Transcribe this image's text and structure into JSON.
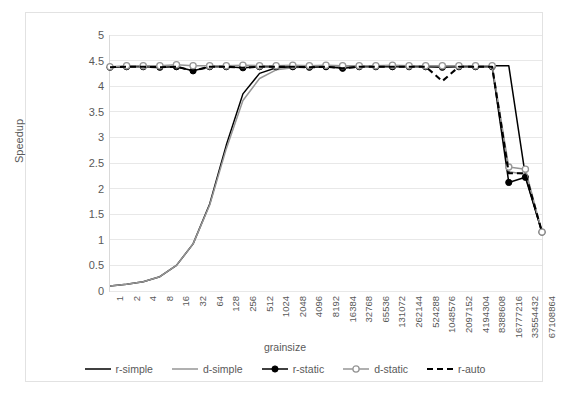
{
  "chart_data": {
    "type": "line",
    "title": "",
    "xlabel": "grainsize",
    "ylabel": "Speedup",
    "ylim": [
      0,
      5
    ],
    "ytick_step": 0.5,
    "yticks": [
      5,
      4.5,
      4,
      3.5,
      3,
      2.5,
      2,
      1.5,
      1,
      0.5,
      0
    ],
    "grid": "horizontal",
    "legend_position": "bottom",
    "x_is_categorical": true,
    "categories": [
      "1",
      "2",
      "4",
      "8",
      "16",
      "32",
      "64",
      "128",
      "256",
      "512",
      "1024",
      "2048",
      "4096",
      "8192",
      "16384",
      "32768",
      "65536",
      "131072",
      "262144",
      "524288",
      "1048576",
      "2097152",
      "4194304",
      "8388608",
      "16777216",
      "33554432",
      "67108864"
    ],
    "series": [
      {
        "name": "r-simple",
        "color": "#000000",
        "style": "solid",
        "marker": "none",
        "values": [
          0.1,
          0.13,
          0.18,
          0.28,
          0.5,
          0.92,
          1.7,
          2.85,
          3.85,
          4.25,
          4.36,
          4.38,
          4.39,
          4.39,
          4.4,
          4.4,
          4.4,
          4.4,
          4.4,
          4.4,
          4.4,
          4.4,
          4.4,
          4.4,
          4.4,
          2.25,
          1.15
        ]
      },
      {
        "name": "d-simple",
        "color": "#969696",
        "style": "solid",
        "marker": "none",
        "values": [
          0.1,
          0.13,
          0.18,
          0.28,
          0.5,
          0.92,
          1.68,
          2.78,
          3.72,
          4.15,
          4.32,
          4.36,
          4.38,
          4.38,
          4.39,
          4.39,
          4.39,
          4.39,
          4.39,
          4.39,
          4.39,
          4.39,
          4.39,
          4.39,
          2.33,
          2.28,
          1.15
        ]
      },
      {
        "name": "r-static",
        "color": "#000000",
        "style": "solid",
        "marker": "filled-circle",
        "values": [
          4.37,
          4.38,
          4.38,
          4.37,
          4.38,
          4.3,
          4.38,
          4.38,
          4.36,
          4.38,
          4.38,
          4.38,
          4.37,
          4.38,
          4.35,
          4.38,
          4.38,
          4.38,
          4.38,
          4.38,
          4.37,
          4.38,
          4.38,
          4.38,
          2.12,
          2.22,
          1.15
        ]
      },
      {
        "name": "d-static",
        "color": "#969696",
        "style": "solid",
        "marker": "open-circle",
        "values": [
          4.38,
          4.4,
          4.4,
          4.4,
          4.42,
          4.4,
          4.4,
          4.4,
          4.41,
          4.4,
          4.4,
          4.41,
          4.4,
          4.41,
          4.4,
          4.4,
          4.4,
          4.41,
          4.4,
          4.4,
          4.4,
          4.4,
          4.4,
          4.4,
          2.42,
          2.38,
          1.15
        ]
      },
      {
        "name": "r-auto",
        "color": "#000000",
        "style": "dashed",
        "marker": "none",
        "values": [
          4.37,
          4.38,
          4.38,
          4.37,
          4.38,
          4.3,
          4.38,
          4.38,
          4.36,
          4.38,
          4.38,
          4.38,
          4.37,
          4.38,
          4.35,
          4.38,
          4.38,
          4.38,
          4.38,
          4.38,
          4.1,
          4.38,
          4.38,
          4.38,
          2.3,
          2.3,
          1.15
        ]
      }
    ]
  },
  "legend": {
    "items": [
      {
        "label": "r-simple",
        "swatch": "line-solid-black"
      },
      {
        "label": "d-simple",
        "swatch": "line-solid-gray"
      },
      {
        "label": "r-static",
        "swatch": "line-solid-black-dot"
      },
      {
        "label": "d-static",
        "swatch": "line-solid-gray-circle"
      },
      {
        "label": "r-auto",
        "swatch": "line-dashed-black"
      }
    ]
  },
  "axes": {
    "y_title": "Speedup",
    "x_title": "grainsize"
  },
  "caption": ""
}
